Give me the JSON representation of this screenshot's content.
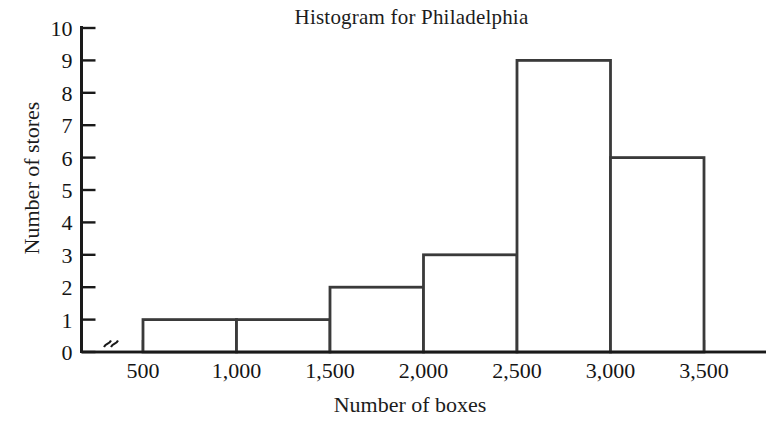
{
  "chart_data": {
    "type": "bar",
    "title": "Histogram for Philadelphia",
    "xlabel": "Number of boxes",
    "ylabel": "Number of stores",
    "categories": [
      "500-1,000",
      "1,000-1,500",
      "1,500-2,000",
      "2,000-2,500",
      "2,500-3,000",
      "3,000-3,500"
    ],
    "bin_edges": [
      500,
      1000,
      1500,
      2000,
      2500,
      3000,
      3500
    ],
    "values": [
      1,
      1,
      2,
      3,
      9,
      6
    ],
    "x_tick_labels": [
      "500",
      "1,000",
      "1,500",
      "2,000",
      "2,500",
      "3,000",
      "3,500"
    ],
    "y_tick_labels": [
      "0",
      "1",
      "2",
      "3",
      "4",
      "5",
      "6",
      "7",
      "8",
      "9",
      "10"
    ],
    "y_ticks": [
      0,
      1,
      2,
      3,
      4,
      5,
      6,
      7,
      8,
      9,
      10
    ],
    "ylim": [
      0,
      10
    ],
    "xlim": [
      500,
      3500
    ],
    "grid": false,
    "legend": null,
    "axis_break": "x-axis break between origin and 500",
    "bar_fill": "#ffffff",
    "bar_stroke": "#3a3a3a",
    "axis_color": "#1a1a1a"
  },
  "figure": {
    "title": "Histogram for Philadelphia",
    "y_axis_title": "Number of stores",
    "x_axis_title": "Number of boxes"
  }
}
